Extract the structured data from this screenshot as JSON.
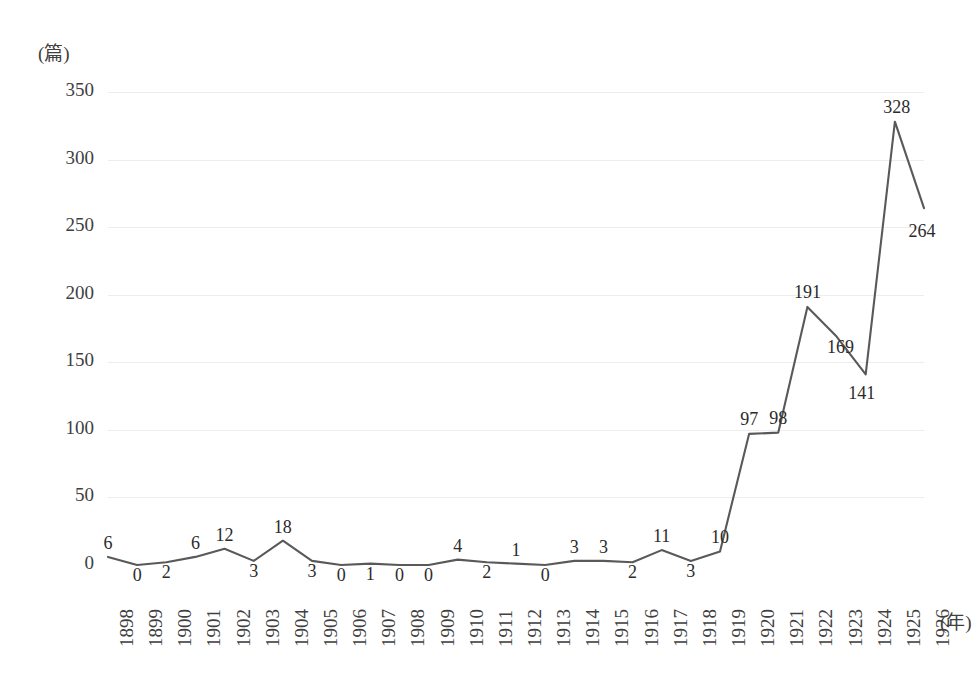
{
  "chart_data": {
    "type": "line",
    "title": "",
    "xlabel": "(年)",
    "ylabel": "(篇)",
    "categories": [
      "1898",
      "1899",
      "1900",
      "1901",
      "1902",
      "1903",
      "1904",
      "1905",
      "1906",
      "1907",
      "1908",
      "1909",
      "1910",
      "1911",
      "1912",
      "1913",
      "1914",
      "1915",
      "1916",
      "1917",
      "1918",
      "1919",
      "1920",
      "1921",
      "1922",
      "1923",
      "1924",
      "1925",
      "1926"
    ],
    "values": [
      6,
      0,
      2,
      6,
      12,
      3,
      18,
      3,
      0,
      1,
      0,
      0,
      4,
      2,
      1,
      0,
      3,
      3,
      2,
      11,
      3,
      10,
      97,
      98,
      191,
      169,
      141,
      328,
      264
    ],
    "ylim": [
      0,
      350
    ],
    "yticks": [
      "0",
      "50",
      "100",
      "150",
      "200",
      "250",
      "300",
      "350"
    ],
    "grid": true,
    "legend": "none",
    "series_color": "#595959",
    "grid_color": "#ededed",
    "text_color": "#404040",
    "data_labels": true
  }
}
